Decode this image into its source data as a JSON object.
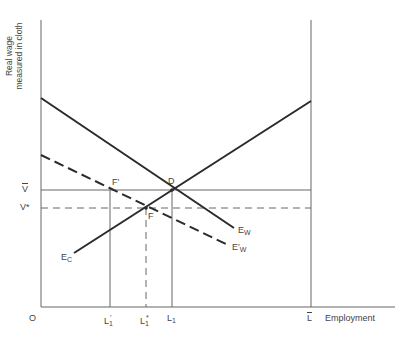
{
  "diagram": {
    "y_axis_label_line1": "Real wage",
    "y_axis_label_line2": "measured in cloth",
    "x_axis_label": "Employment",
    "origin_label": "O",
    "y_ticks": {
      "v_bar": "V",
      "v_star": "V*"
    },
    "x_ticks": {
      "l1_prime": "L",
      "l1_prime_sub": "1",
      "l1_prime_mark": "′",
      "l1_star": "L",
      "l1_star_sub": "1",
      "l1_star_mark": "*",
      "l1": "L",
      "l1_sub": "1",
      "l_bar": "L"
    },
    "points": {
      "d": "D",
      "f": "F",
      "f_prime": "F′"
    },
    "curves": {
      "ew": "E",
      "ew_sub": "W",
      "ew_prime": "E′",
      "ew_prime_sub": "W",
      "ec": "E",
      "ec_sub": "C"
    },
    "colors": {
      "line": "#2a2a2a",
      "thin_line": "#555555",
      "text": "#444444"
    }
  }
}
